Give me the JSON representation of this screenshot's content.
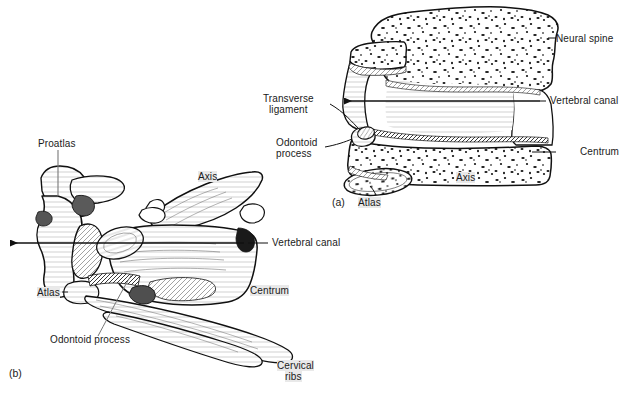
{
  "figure": {
    "ink_color": "#111111",
    "paper_color": "#ffffff",
    "highlight_color": "#e9e9e9"
  },
  "panels": [
    {
      "id": "a",
      "tag": "(a)",
      "description": "sagittal section of atlas and axis"
    },
    {
      "id": "b",
      "tag": "(b)",
      "description": "lateral view with proatlas and cervical ribs"
    }
  ],
  "labels_a": {
    "neural_spine": "Neural spine",
    "vertebral_canal": "Vertebral canal",
    "centrum": "Centrum",
    "transverse_ligament": "Transverse\nligament",
    "transverse_ligament_l1": "Transverse",
    "transverse_ligament_l2": "ligament",
    "odontoid_process_l1": "Odontoid",
    "odontoid_process_l2": "process",
    "axis": "Axis",
    "atlas": "Atlas"
  },
  "labels_b": {
    "proatlas": "Proatlas",
    "axis": "Axis",
    "vertebral_canal": "Vertebral canal",
    "centrum": "Centrum",
    "atlas": "Atlas",
    "odontoid_process": "Odontoid process",
    "cervical_ribs_l1": "Cervical",
    "cervical_ribs_l2": "ribs"
  }
}
